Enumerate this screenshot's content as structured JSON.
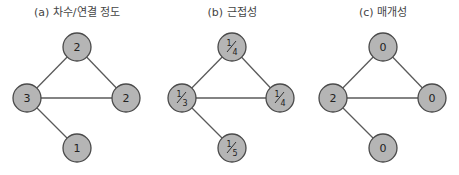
{
  "panels": [
    {
      "title": "(a) 차수/연결 정도",
      "value_type": "integer",
      "nodes": [
        {
          "id": "top",
          "x": 77,
          "y": 47,
          "label": "2"
        },
        {
          "id": "left",
          "x": 27,
          "y": 98,
          "label": "3"
        },
        {
          "id": "right",
          "x": 126,
          "y": 98,
          "label": "2"
        },
        {
          "id": "bottom",
          "x": 77,
          "y": 148,
          "label": "1"
        }
      ]
    },
    {
      "title": "(b) 근접성",
      "value_type": "fraction",
      "nodes": [
        {
          "id": "top",
          "x": 232,
          "y": 47,
          "num": "1",
          "den": "4"
        },
        {
          "id": "left",
          "x": 182,
          "y": 98,
          "num": "1",
          "den": "3"
        },
        {
          "id": "right",
          "x": 280,
          "y": 98,
          "num": "1",
          "den": "4"
        },
        {
          "id": "bottom",
          "x": 232,
          "y": 148,
          "num": "1",
          "den": "5"
        }
      ]
    },
    {
      "title": "(c) 매개성",
      "value_type": "integer",
      "nodes": [
        {
          "id": "top",
          "x": 383,
          "y": 47,
          "label": "0"
        },
        {
          "id": "left",
          "x": 333,
          "y": 98,
          "label": "2"
        },
        {
          "id": "right",
          "x": 432,
          "y": 98,
          "label": "0"
        },
        {
          "id": "bottom",
          "x": 383,
          "y": 148,
          "label": "0"
        }
      ]
    }
  ],
  "edges": [
    [
      "left",
      "top"
    ],
    [
      "top",
      "right"
    ],
    [
      "left",
      "right"
    ],
    [
      "left",
      "bottom"
    ]
  ],
  "colors": {
    "node_fill": "#b5b5b5",
    "node_stroke": "#4a4a4a",
    "edge": "#5a5a5a",
    "text": "#222222"
  }
}
